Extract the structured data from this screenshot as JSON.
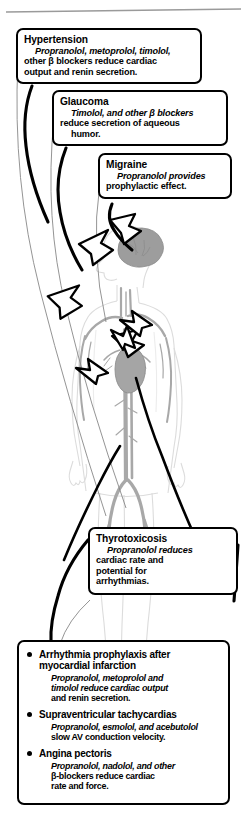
{
  "figure": {
    "colors": {
      "outline": "#000000",
      "box_fill": "#ffffff",
      "body_outline": "#d8d8d8",
      "brain_fill": "#9d9d9d",
      "vessel": "#a8a8a8",
      "heart_fill": "#a5a5a5",
      "top_rule": "#9a9a9a"
    }
  },
  "callouts": [
    {
      "id": "hypertension",
      "heading": "Hypertension",
      "line1": "Propranolol, metoprolol, timolol,",
      "line2": "other β blockers reduce cardiac",
      "line3": "output and renin secretion."
    },
    {
      "id": "glaucoma",
      "heading": "Glaucoma",
      "line1": "Timolol, and other β blockers",
      "line2": "reduce secretion of aqueous",
      "line3": "humor."
    },
    {
      "id": "migraine",
      "heading": "Migraine",
      "line1": "Propranolol provides",
      "line2": "prophylactic effect.",
      "line3": ""
    },
    {
      "id": "thyrotoxicosis",
      "heading": "Thyrotoxicosis",
      "line1": "Propranolol reduces",
      "line2": "cardiac rate and",
      "line3": "potential for",
      "line4": "arrhythmias."
    }
  ],
  "list": {
    "items": [
      {
        "title_line1": "Arrhythmia prophylaxis after",
        "title_line2": "myocardial infarction",
        "body_line1": "Propranolol, metoprolol and",
        "body_line2": "timolol reduce cardiac output",
        "body_line3": "and renin secretion."
      },
      {
        "title_line1": "Supraventricular tachycardias",
        "title_line2": "",
        "body_line1": "Propranolol, esmolol, and acebutolol",
        "body_line2": "slow AV conduction velocity.",
        "body_line3": ""
      },
      {
        "title_line1": "Angina pectoris",
        "title_line2": "",
        "body_line1": "Propranolol, nadolol, and other",
        "body_line2": "β-blockers reduce cardiac",
        "body_line3": "rate and force."
      }
    ]
  },
  "anatomy": {
    "labels": [
      "brain",
      "head",
      "torso",
      "heart",
      "aorta",
      "arteries",
      "legs",
      "feet"
    ]
  }
}
